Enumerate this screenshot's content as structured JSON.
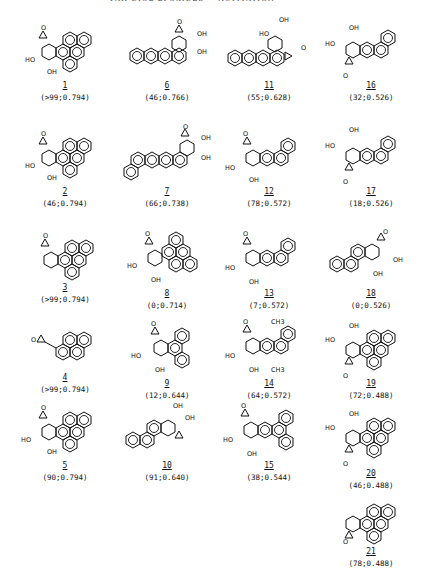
{
  "header": {
    "text": "PAH DIOL EPOXIDES — ACTIVATION"
  },
  "compounds": [
    {
      "id": "1",
      "label": "1",
      "values": "(>99;0.794)"
    },
    {
      "id": "2",
      "label": "2",
      "values": "(46;0.794)"
    },
    {
      "id": "3",
      "label": "3",
      "values": "(>99;0.794)"
    },
    {
      "id": "4",
      "label": "4",
      "values": "(>99;0.794)"
    },
    {
      "id": "5",
      "label": "5",
      "values": "(90;0.794)"
    },
    {
      "id": "6",
      "label": "6",
      "values": "(46;0.766)"
    },
    {
      "id": "7",
      "label": "7",
      "values": "(66;0.738)"
    },
    {
      "id": "8",
      "label": "8",
      "values": "(0;0.714)"
    },
    {
      "id": "9",
      "label": "9",
      "values": "(12;0.644)"
    },
    {
      "id": "10",
      "label": "10",
      "values": "(91;0.640)"
    },
    {
      "id": "11",
      "label": "11",
      "values": "(55;0.628)"
    },
    {
      "id": "12",
      "label": "12",
      "values": "(78;0.572)"
    },
    {
      "id": "13",
      "label": "13",
      "values": "(7;0.572)"
    },
    {
      "id": "14",
      "label": "14",
      "values": "(64;0.572)"
    },
    {
      "id": "15",
      "label": "15",
      "values": "(38;0.544)"
    },
    {
      "id": "16",
      "label": "16",
      "values": "(32;0.526)"
    },
    {
      "id": "17",
      "label": "17",
      "values": "(18;0.526)"
    },
    {
      "id": "18",
      "label": "18",
      "values": "(0;0.526)"
    },
    {
      "id": "19",
      "label": "19",
      "values": "(72;0.488)"
    },
    {
      "id": "20",
      "label": "20",
      "values": "(46;0.488)"
    },
    {
      "id": "21",
      "label": "21",
      "values": "(78;0.488)"
    }
  ],
  "atoms": {
    "oh": "OH",
    "ho": "HO",
    "o": "O",
    "ch3": "CH3"
  }
}
